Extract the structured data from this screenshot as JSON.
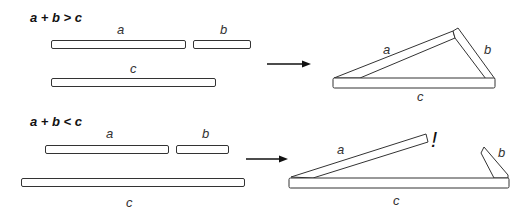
{
  "panels": [
    {
      "title": "a + b > c",
      "labels": {
        "a": "a",
        "b": "b",
        "c": "c"
      },
      "result_labels": {
        "a": "a",
        "b": "b",
        "c": "c"
      },
      "outcome": "triangle forms"
    },
    {
      "title": "a + b < c",
      "labels": {
        "a": "a",
        "b": "b",
        "c": "c"
      },
      "result_labels": {
        "a": "a",
        "b": "b",
        "c": "c"
      },
      "exclamation": "!",
      "outcome": "triangle does not close"
    }
  ],
  "colors": {
    "stroke": "#333333",
    "background": "#ffffff"
  }
}
